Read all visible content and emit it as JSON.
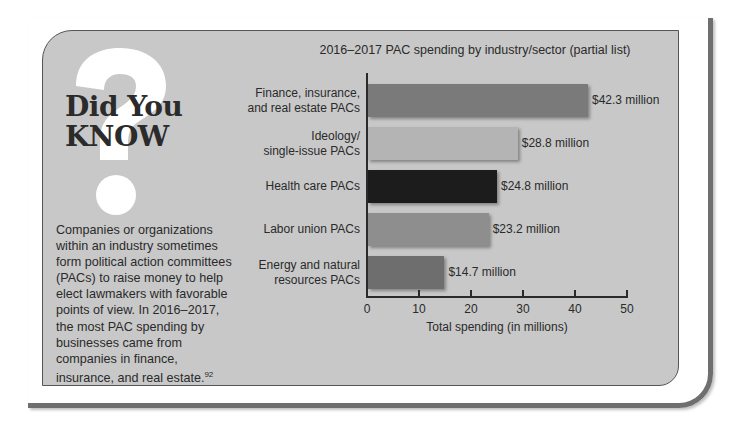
{
  "sidebar": {
    "heading_line1": "Did You",
    "heading_line2": "KNOW",
    "body": "Companies or organizations within an industry sometimes form political action committees (PACs) to raise money to help elect lawmakers with favorable points of view. In 2016–2017, the most PAC spending by businesses came from companies in finance, insurance, and real estate.",
    "footnote": "92",
    "icon": "question-mark-icon"
  },
  "chart_data": {
    "type": "bar",
    "orientation": "horizontal",
    "title": "2016–2017 PAC spending by industry/sector (partial list)",
    "xlabel": "Total spending (in millions)",
    "ylabel": "",
    "xlim": [
      0,
      50
    ],
    "xticks": [
      "0",
      "10",
      "20",
      "30",
      "40",
      "50"
    ],
    "grid": false,
    "legend": null,
    "categories": [
      "Finance, insurance, and real estate PACs",
      "Ideology/ single-issue PACs",
      "Health care PACs",
      "Labor union PACs",
      "Energy and natural resources PACs"
    ],
    "category_lines": [
      [
        "Finance, insurance,",
        "and real estate PACs"
      ],
      [
        "Ideology/",
        "single-issue PACs"
      ],
      [
        "Health care PACs"
      ],
      [
        "Labor union PACs"
      ],
      [
        "Energy and natural",
        "resources PACs"
      ]
    ],
    "values": [
      42.3,
      28.8,
      24.8,
      23.2,
      14.7
    ],
    "value_labels": [
      "$42.3 million",
      "$28.8 million",
      "$24.8 million",
      "$23.2 million",
      "$14.7 million"
    ],
    "colors": [
      "#7a7a7a",
      "#b4b4b4",
      "#1c1c1c",
      "#8e8e8e",
      "#6e6e6e"
    ]
  }
}
